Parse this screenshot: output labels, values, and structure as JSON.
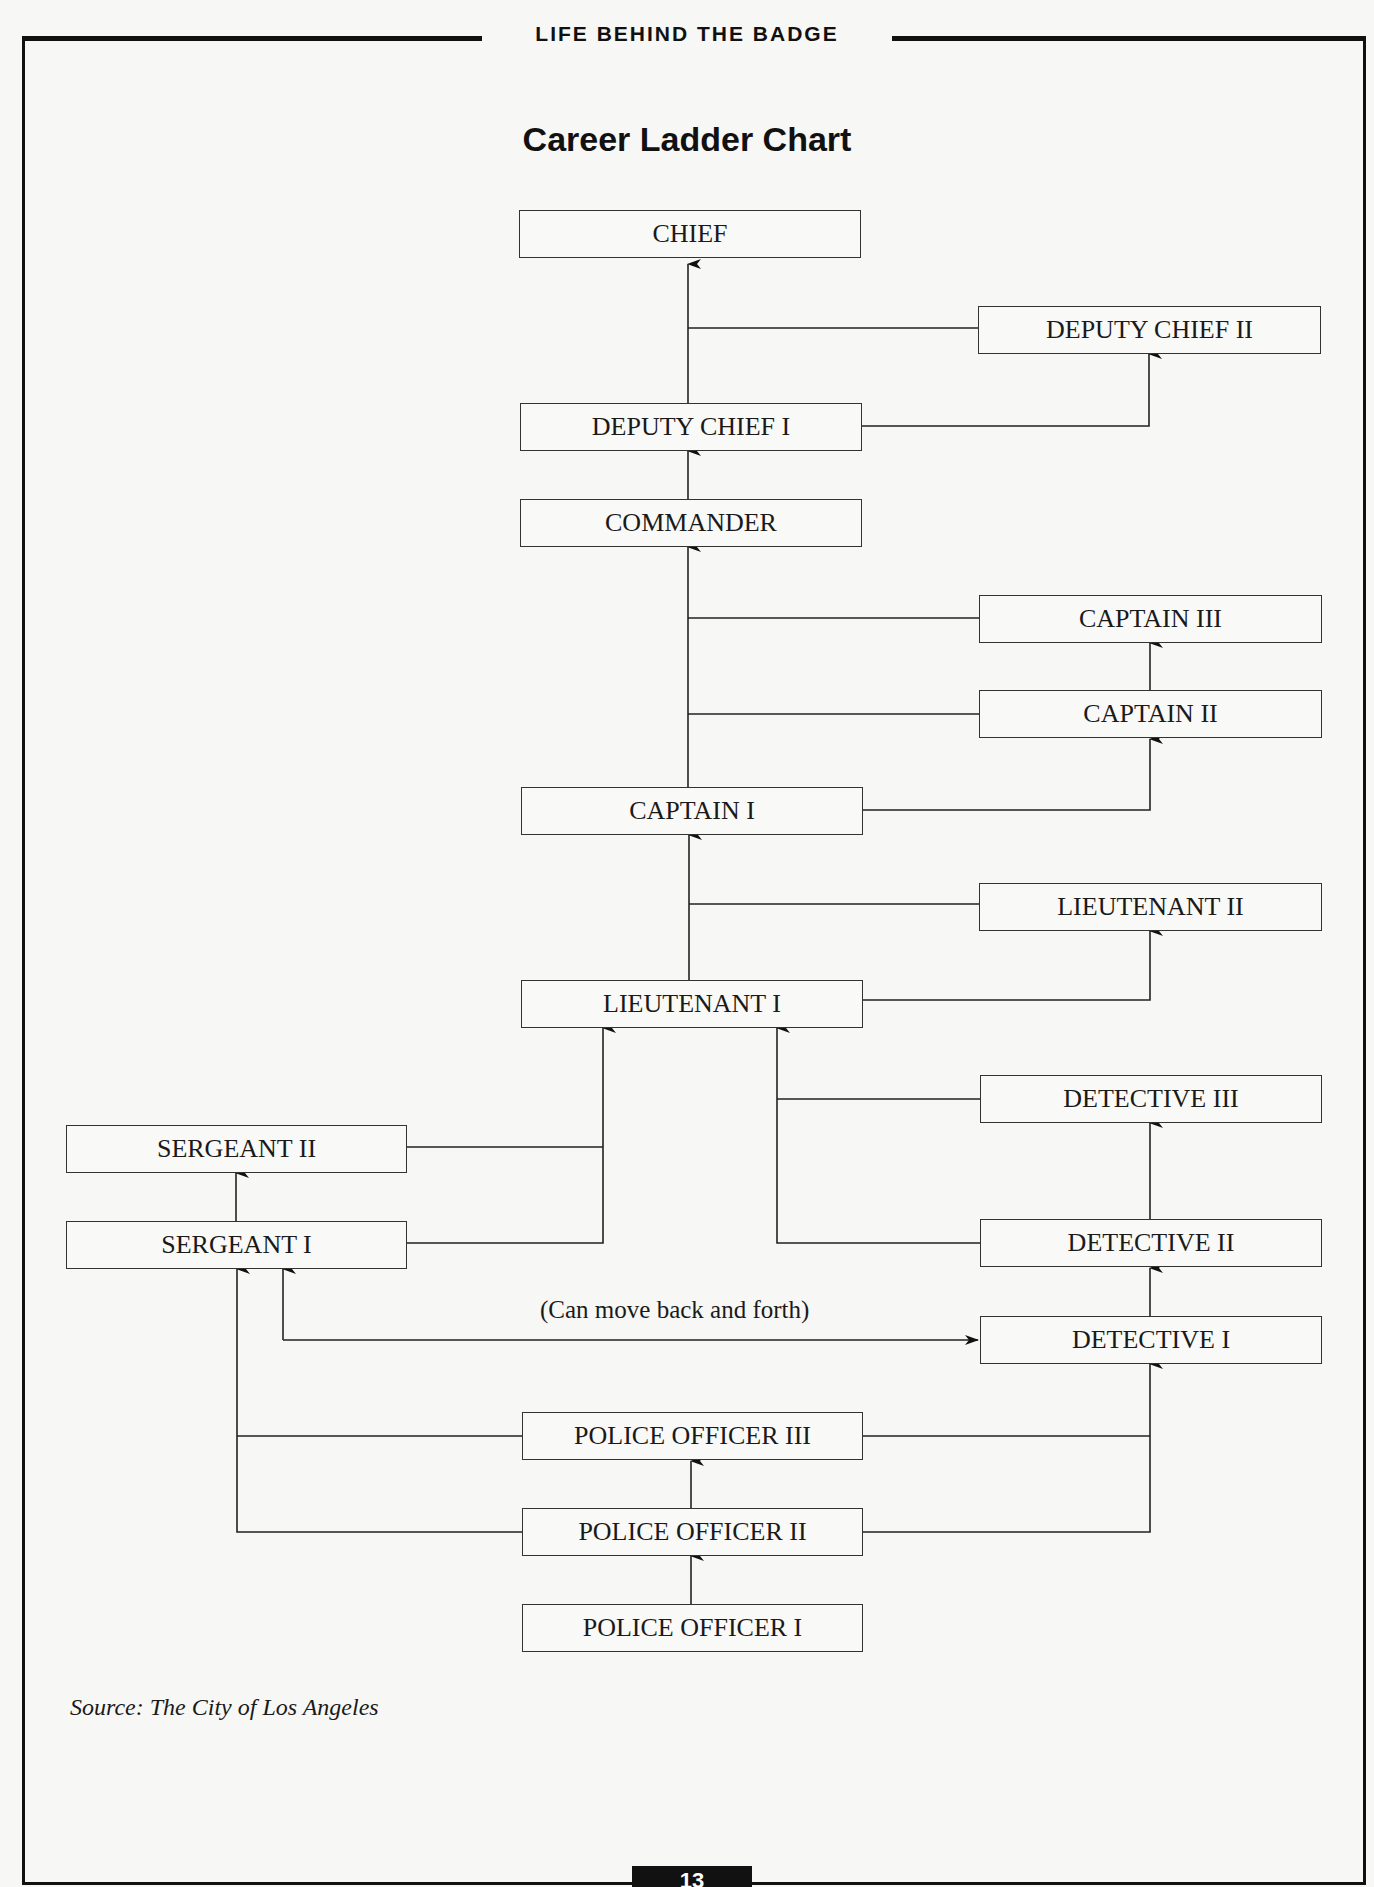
{
  "header": {
    "section_title": "LIFE BEHIND THE BADGE"
  },
  "chart": {
    "title": "Career Ladder Chart",
    "note": "(Can move back and forth)",
    "source": "Source: The City of Los Angeles"
  },
  "positions": {
    "chief": "CHIEF",
    "deputy_chief_2": "DEPUTY CHIEF II",
    "deputy_chief_1": "DEPUTY CHIEF I",
    "commander": "COMMANDER",
    "captain_3": "CAPTAIN III",
    "captain_2": "CAPTAIN II",
    "captain_1": "CAPTAIN I",
    "lieutenant_2": "LIEUTENANT II",
    "lieutenant_1": "LIEUTENANT I",
    "detective_3": "DETECTIVE III",
    "sergeant_2": "SERGEANT II",
    "sergeant_1": "SERGEANT I",
    "detective_2": "DETECTIVE II",
    "detective_1": "DETECTIVE I",
    "police_officer_3": "POLICE OFFICER III",
    "police_officer_2": "POLICE OFFICER II",
    "police_officer_1": "POLICE OFFICER I"
  },
  "edges": [
    [
      "POLICE OFFICER I",
      "POLICE OFFICER II"
    ],
    [
      "POLICE OFFICER II",
      "POLICE OFFICER III"
    ],
    [
      "POLICE OFFICER II",
      "SERGEANT I"
    ],
    [
      "POLICE OFFICER III",
      "SERGEANT I"
    ],
    [
      "POLICE OFFICER II",
      "DETECTIVE I"
    ],
    [
      "POLICE OFFICER III",
      "DETECTIVE I"
    ],
    [
      "SERGEANT I",
      "DETECTIVE I",
      "bidirectional"
    ],
    [
      "SERGEANT I",
      "SERGEANT II"
    ],
    [
      "SERGEANT I",
      "LIEUTENANT I"
    ],
    [
      "SERGEANT II",
      "LIEUTENANT I"
    ],
    [
      "DETECTIVE I",
      "DETECTIVE II"
    ],
    [
      "DETECTIVE II",
      "DETECTIVE III"
    ],
    [
      "DETECTIVE II",
      "LIEUTENANT I"
    ],
    [
      "DETECTIVE III",
      "LIEUTENANT I"
    ],
    [
      "LIEUTENANT I",
      "LIEUTENANT II"
    ],
    [
      "LIEUTENANT I",
      "CAPTAIN I"
    ],
    [
      "LIEUTENANT II",
      "CAPTAIN I"
    ],
    [
      "CAPTAIN I",
      "CAPTAIN II"
    ],
    [
      "CAPTAIN II",
      "CAPTAIN III"
    ],
    [
      "CAPTAIN I",
      "COMMANDER"
    ],
    [
      "CAPTAIN II",
      "COMMANDER"
    ],
    [
      "CAPTAIN III",
      "COMMANDER"
    ],
    [
      "COMMANDER",
      "DEPUTY CHIEF I"
    ],
    [
      "DEPUTY CHIEF I",
      "DEPUTY CHIEF II"
    ],
    [
      "DEPUTY CHIEF I",
      "CHIEF"
    ],
    [
      "DEPUTY CHIEF II",
      "CHIEF"
    ]
  ],
  "footer": {
    "page_number": "13"
  }
}
